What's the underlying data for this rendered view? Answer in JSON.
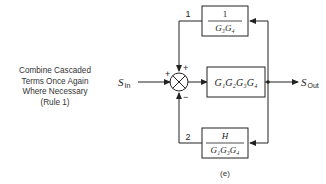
{
  "caption": {
    "lines": [
      "Combine Cascaded",
      "Terms Once Again",
      "Where Necessary",
      "(Rule 1)"
    ]
  },
  "diagram": {
    "input_label": "S",
    "input_sub": "In",
    "output_label": "S",
    "output_sub": "Out",
    "forward_block": "G₁G₂G₃G₄",
    "feedback1": {
      "path_number": "1",
      "numerator": "1",
      "denominator": "G₃G₄"
    },
    "feedback2": {
      "path_number": "2",
      "numerator": "H",
      "denominator": "G₁G₃G₄"
    },
    "summing_signs": {
      "left": "+",
      "top": "+",
      "bottom": "−"
    },
    "figure_label": "(e)"
  }
}
